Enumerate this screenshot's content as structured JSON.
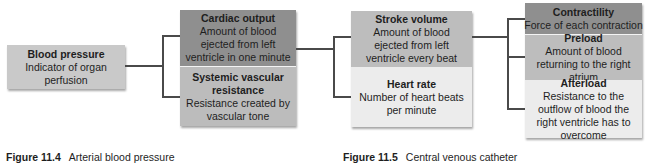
{
  "figures": [
    {
      "caption_number": "Figure 11.4",
      "caption_text": "Arterial blood pressure",
      "root": {
        "title": "Blood pressure",
        "desc": "Indicator of organ perfusion"
      },
      "components": [
        {
          "title": "Cardiac output",
          "desc": "Amount of blood ejected from left ventricle in one minute"
        },
        {
          "title": "Systemic vascular resistance",
          "desc": "Resistance created by vascular tone"
        }
      ]
    },
    {
      "caption_number": "Figure 11.5",
      "caption_text": "Central venous catheter",
      "root": [
        {
          "title": "Stroke volume",
          "desc": "Amount of blood ejected from left ventricle every beat"
        },
        {
          "title": "Heart rate",
          "desc": "Number of heart beats per minute"
        }
      ],
      "components": [
        {
          "title": "Contractility",
          "desc": "Force of each contraction"
        },
        {
          "title": "Preload",
          "desc": "Amount of blood returning to the right atrium"
        },
        {
          "title": "Afterload",
          "desc": "Resistance to the outflow of blood the right ventricle has to overcome"
        }
      ]
    }
  ],
  "colors": {
    "dark": "#8f8f8f",
    "medium": "#bdbdbd",
    "light": "#ececec",
    "root": "#c8c8c8",
    "line": "#4a4a4a"
  }
}
